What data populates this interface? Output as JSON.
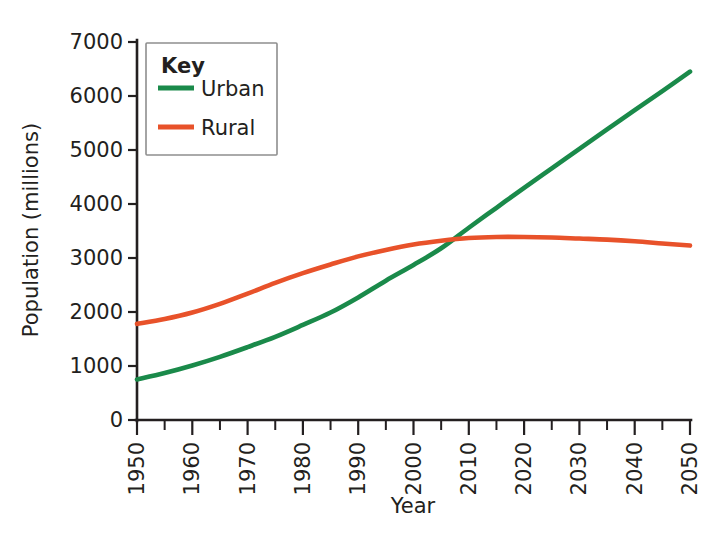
{
  "chart_data": {
    "type": "line",
    "title": "",
    "xlabel": "Year",
    "ylabel": "Population (millions)",
    "xlim": [
      1950,
      2050
    ],
    "ylim": [
      0,
      7000
    ],
    "grid": false,
    "legend_position": "top-left",
    "legend_title": "Key",
    "x_tick_labels": [
      "1950",
      "1960",
      "1970",
      "1980",
      "1990",
      "2000",
      "2010",
      "2020",
      "2030",
      "2040",
      "2050"
    ],
    "x_tick_values": [
      1950,
      1960,
      1970,
      1980,
      1990,
      2000,
      2010,
      2020,
      2030,
      2040,
      2050
    ],
    "x_minor_tick_values": [
      1955,
      1965,
      1975,
      1985,
      1995,
      2005,
      2015,
      2025,
      2035,
      2045
    ],
    "y_tick_labels": [
      "0",
      "1000",
      "2000",
      "3000",
      "4000",
      "5000",
      "6000",
      "7000"
    ],
    "y_tick_values": [
      0,
      1000,
      2000,
      3000,
      4000,
      5000,
      6000,
      7000
    ],
    "x": [
      1950,
      1955,
      1960,
      1965,
      1970,
      1975,
      1980,
      1985,
      1990,
      1995,
      2000,
      2005,
      2010,
      2015,
      2020,
      2025,
      2030,
      2035,
      2040,
      2045,
      2050
    ],
    "series": [
      {
        "name": "Urban",
        "color": "#1a8a4a",
        "values": [
          750,
          870,
          1010,
          1170,
          1350,
          1540,
          1760,
          1990,
          2270,
          2580,
          2870,
          3180,
          3560,
          3930,
          4300,
          4660,
          5020,
          5380,
          5740,
          6090,
          6450
        ]
      },
      {
        "name": "Rural",
        "color": "#e8522a",
        "values": [
          1780,
          1870,
          1990,
          2150,
          2340,
          2540,
          2720,
          2880,
          3030,
          3150,
          3250,
          3320,
          3370,
          3390,
          3390,
          3380,
          3360,
          3340,
          3310,
          3270,
          3230
        ]
      }
    ],
    "annotations": [
      {
        "text": "crossover",
        "x": 2007,
        "y": 3350
      }
    ]
  },
  "legend": {
    "title": "Key",
    "entries": [
      {
        "label": "Urban",
        "color": "#1a8a4a"
      },
      {
        "label": "Rural",
        "color": "#e8522a"
      }
    ]
  },
  "axes": {
    "x_title": "Year",
    "y_title": "Population (millions)"
  }
}
